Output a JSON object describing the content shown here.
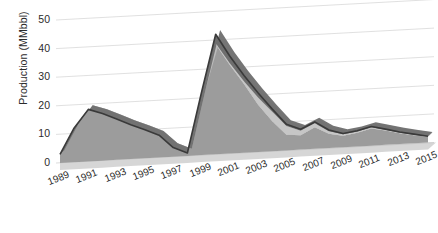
{
  "chart_data": {
    "type": "area",
    "stacked": true,
    "three_d": true,
    "title": "",
    "xlabel": "",
    "ylabel": "Production (MMbbl)",
    "ylim": [
      0,
      50
    ],
    "yticks": [
      0,
      10,
      20,
      30,
      40,
      50
    ],
    "grid": true,
    "legend_position": "none",
    "x_tick_step": 2,
    "x": [
      1989,
      1990,
      1991,
      1992,
      1993,
      1994,
      1995,
      1996,
      1997,
      1998,
      1999,
      2000,
      2001,
      2002,
      2003,
      2004,
      2005,
      2006,
      2007,
      2008,
      2009,
      2010,
      2011,
      2012,
      2013,
      2014,
      2015
    ],
    "xticks": [
      "1989",
      "1991",
      "1993",
      "1995",
      "1997",
      "1999",
      "2001",
      "2003",
      "2005",
      "2007",
      "2009",
      "2011",
      "2013",
      "2015"
    ],
    "series": [
      {
        "name": "series-1-lower",
        "color": "#9c9c9c",
        "values": [
          3.0,
          12.0,
          18.2,
          16.5,
          14.3,
          12.0,
          10.0,
          7.8,
          3.2,
          1.0,
          22.0,
          38.5,
          31.0,
          24.0,
          16.5,
          10.5,
          5.5,
          5.0,
          7.5,
          5.0,
          4.0,
          4.8,
          6.0,
          5.0,
          3.8,
          2.8,
          2.0
        ]
      },
      {
        "name": "series-2-middle",
        "color": "#c6c6c6",
        "values": [
          0.0,
          0.0,
          0.0,
          0.0,
          0.0,
          0.0,
          0.0,
          0.0,
          0.0,
          0.0,
          0.0,
          0.3,
          0.6,
          1.0,
          2.5,
          3.3,
          3.0,
          1.6,
          1.4,
          0.9,
          0.5,
          0.4,
          0.4,
          0.3,
          0.2,
          0.2,
          0.1
        ]
      },
      {
        "name": "series-3-upper",
        "color": "#6e6e6e",
        "values": [
          0.0,
          0.0,
          0.0,
          0.0,
          0.0,
          0.0,
          0.0,
          0.0,
          0.0,
          0.0,
          0.0,
          3.2,
          2.4,
          2.0,
          1.6,
          0.9,
          0.6,
          0.5,
          0.5,
          0.4,
          0.3,
          0.3,
          0.3,
          0.2,
          0.2,
          0.2,
          0.1
        ]
      }
    ],
    "totals": [
      3.0,
      12.0,
      18.2,
      16.5,
      14.3,
      12.0,
      10.0,
      7.8,
      3.2,
      1.0,
      22.0,
      42.0,
      34.0,
      27.0,
      20.6,
      14.7,
      9.1,
      7.1,
      9.4,
      6.3,
      4.8,
      5.5,
      6.7,
      5.5,
      4.2,
      3.2,
      2.2
    ]
  },
  "axes": {
    "y_label": "Production (MMbbl)",
    "y_tick_labels": [
      "50",
      "40",
      "30",
      "20",
      "10",
      "0"
    ],
    "x_tick_labels": [
      "1989",
      "1991",
      "1993",
      "1995",
      "1997",
      "1999",
      "2001",
      "2003",
      "2005",
      "2007",
      "2009",
      "2011",
      "2013",
      "2015"
    ]
  },
  "colors": {
    "grid": "#dcdcdc",
    "floor": "#b5b5b5",
    "band_upper": "#6e6e6e",
    "band_middle": "#c6c6c6",
    "band_lower": "#9c9c9c",
    "outline": "#3a3a3a",
    "text": "#2b2b2b",
    "background": "#ffffff"
  }
}
